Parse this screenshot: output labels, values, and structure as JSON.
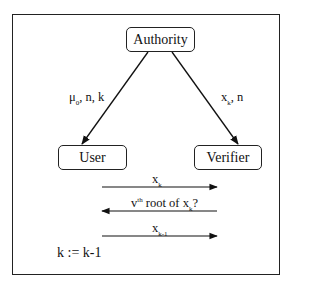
{
  "diagram": {
    "nodes": {
      "authority": "Authority",
      "user": "User",
      "verifier": "Verifier"
    },
    "edges": [
      {
        "from": "Authority",
        "to": "User",
        "label_main": "μ",
        "label_sub": "0",
        "label_rest": ", n, k"
      },
      {
        "from": "Authority",
        "to": "Verifier",
        "label_main": "x",
        "label_sub": "k",
        "label_rest": ", n"
      }
    ],
    "messages": [
      {
        "direction": "right",
        "label_main": "x",
        "label_sub": "k"
      },
      {
        "direction": "left",
        "label_pre": "v",
        "label_sup": "th",
        "label_mid": " root of x",
        "label_sub": "k",
        "label_post": "?"
      },
      {
        "direction": "right",
        "label_main": "x",
        "label_sub": "k-1"
      }
    ],
    "update": "k := k-1"
  }
}
